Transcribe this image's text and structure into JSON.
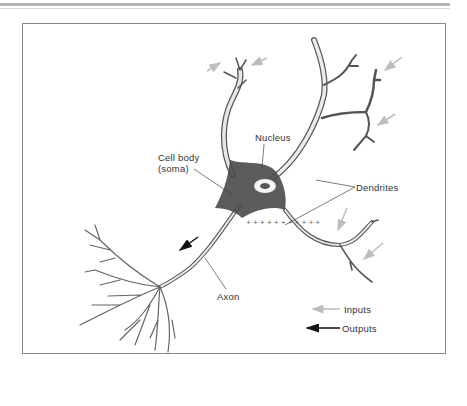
{
  "figure": {
    "labels": {
      "nucleus": "Nucleus",
      "cell_body_line1": "Cell body",
      "cell_body_line2": "(soma)",
      "dendrites": "Dendrites",
      "axon": "Axon"
    },
    "legend": {
      "inputs_label": "Inputs",
      "outputs_label": "Outputs",
      "inputs_color": "#bdbdbd",
      "outputs_color": "#111111"
    },
    "colors": {
      "frame": "#8a8a8a",
      "ink": "#3a3a3a",
      "soma_fill": "#4a4a4a"
    }
  }
}
